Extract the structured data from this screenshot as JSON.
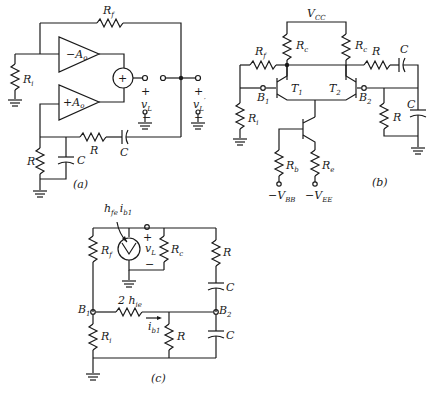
{
  "figure": {
    "panels": [
      {
        "id": "a",
        "caption": "(a)"
      },
      {
        "id": "b",
        "caption": "(b)"
      },
      {
        "id": "c",
        "caption": "(c)"
      }
    ]
  },
  "panel_a": {
    "caption": "(a)",
    "labels": {
      "rf": "R",
      "rf_sub": "f",
      "ri": "R",
      "ri_sub": "i",
      "amp_neg": "−A",
      "amp_neg_sub": "o",
      "amp_pos": "+A",
      "amp_pos_sub": "o",
      "summer": "+",
      "vl": "v",
      "vl_sub": "L",
      "vlp": "v",
      "vlp_sub": "L",
      "vlp_prime": "′",
      "plus": "+",
      "minus": "−",
      "r_series": "R",
      "c_series": "C",
      "r_shunt": "R",
      "c_shunt": "C"
    }
  },
  "panel_b": {
    "caption": "(b)",
    "labels": {
      "vcc": "V",
      "vcc_sub": "CC",
      "rc1": "R",
      "rc1_sub": "c",
      "rc2": "R",
      "rc2_sub": "c",
      "rf": "R",
      "rf_sub": "f",
      "r_series": "R",
      "c_series": "C",
      "t1": "T",
      "t1_sub": "1",
      "t2": "T",
      "t2_sub": "2",
      "b1": "B",
      "b1_sub": "1",
      "b2": "B",
      "b2_sub": "2",
      "ri": "R",
      "ri_sub": "i",
      "r_shunt": "R",
      "c_shunt": "C",
      "rb": "R",
      "rb_sub": "b",
      "re": "R",
      "re_sub": "e",
      "vbb": "−V",
      "vbb_sub": "BB",
      "vee": "−V",
      "vee_sub": "EE"
    }
  },
  "panel_c": {
    "caption": "(c)",
    "labels": {
      "source": "h",
      "source_sub": "fe",
      "source_i": "i",
      "source_i_sub": "b1",
      "rf": "R",
      "rf_sub": "f",
      "vl": "v",
      "vl_sub": "L",
      "plus": "+",
      "minus": "−",
      "rc": "R",
      "rc_sub": "c",
      "r_top": "R",
      "c_top": "C",
      "b1": "B",
      "b1_sub": "1",
      "b2": "B",
      "b2_sub": "2",
      "hie": "2 h",
      "hie_sub": "ie",
      "ib1": "i",
      "ib1_sub": "b1",
      "ri": "R",
      "ri_sub": "i",
      "r_mid": "R",
      "c_bot": "C"
    }
  }
}
